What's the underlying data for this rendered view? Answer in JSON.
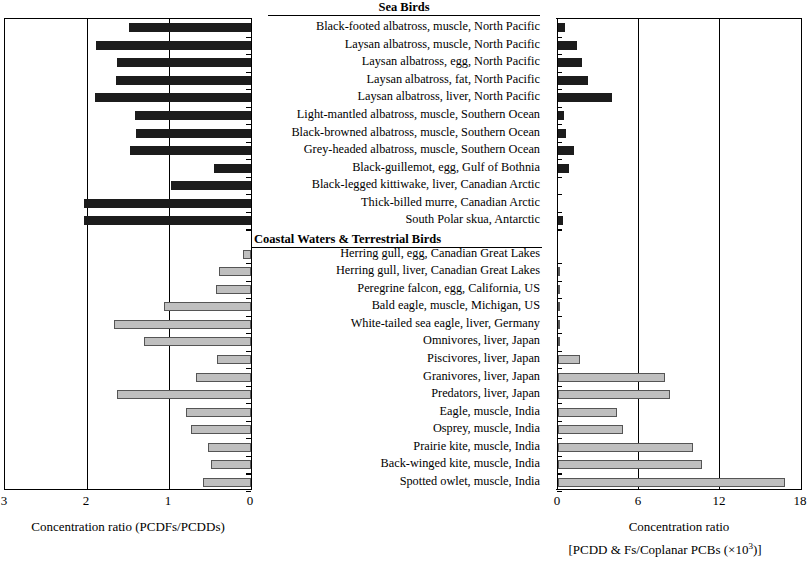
{
  "chart_data": {
    "type": "bar",
    "title": "",
    "orientation": "horizontal",
    "layout": "back-to-back paired horizontal bars with shared centered category labels",
    "groups": [
      {
        "name": "Sea Birds",
        "start_index": 0,
        "count": 12,
        "bar_color": "#1c1c1c"
      },
      {
        "name": "Coastal Waters & Terrestrial Birds",
        "start_index": 12,
        "count": 14,
        "bar_color": "#bfbfbf"
      }
    ],
    "categories": [
      "Black-footed albatross, muscle, North Pacific",
      "Laysan albatross, muscle, North Pacific",
      "Laysan albatross, egg, North Pacific",
      "Laysan albatross, fat, North Pacific",
      "Laysan albatross, liver, North Pacific",
      "Light-mantled albatross, muscle, Southern Ocean",
      "Black-browned albatross, muscle, Southern Ocean",
      "Grey-headed albatross, muscle, Southern Ocean",
      "Black-guillemot, egg, Gulf of Bothnia",
      "Black-legged kittiwake, liver, Canadian Arctic",
      "Thick-billed murre, Canadian Arctic",
      "South Polar skua, Antarctic",
      "Herring gull, egg, Canadian Great Lakes",
      "Herring gull, liver, Canadian Great Lakes",
      "Peregrine falcon, egg, California, US",
      "Bald eagle, muscle, Michigan, US",
      "White-tailed sea eagle, liver, Germany",
      "Omnivores, liver, Japan",
      "Piscivores, liver, Japan",
      "Granivores, liver, Japan",
      "Predators, liver, Japan",
      "Eagle, muscle, India",
      "Osprey, muscle, India",
      "Prairie kite, muscle, India",
      "Back-winged kite, muscle, India",
      "Spotted owlet, muscle, India"
    ],
    "series": [
      {
        "name": "Concentration ratio (PCDFs/PCDDs)",
        "panel": "left",
        "direction": "right-to-left",
        "axis_label": "Concentration ratio (PCDFs/PCDDs)",
        "ticks": [
          3,
          2,
          1,
          0
        ],
        "axis_min": 0,
        "axis_max": 3,
        "values": [
          1.49,
          1.89,
          1.63,
          1.65,
          1.9,
          1.42,
          1.4,
          1.47,
          0.45,
          0.98,
          2.04,
          2.04,
          0.1,
          0.39,
          0.43,
          1.06,
          1.67,
          1.3,
          0.41,
          0.67,
          1.63,
          0.79,
          0.73,
          0.53,
          0.49,
          0.59
        ]
      },
      {
        "name": "Concentration ratio [PCDD & Fs/Coplanar PCBs (x10^3)]",
        "panel": "right",
        "direction": "left-to-right",
        "axis_label_line1": "Concentration ratio",
        "axis_label_line2_prefix": "[PCDD & Fs/Coplanar PCBs (×10",
        "axis_label_line2_sup": "3",
        "axis_label_line2_suffix": ")]",
        "ticks": [
          0,
          6,
          12,
          18
        ],
        "axis_min": 0,
        "axis_max": 18,
        "values": [
          0.5,
          1.4,
          1.8,
          2.2,
          4.0,
          0.45,
          0.6,
          1.2,
          0.85,
          0.0,
          0.0,
          0.4,
          0.0,
          0.1,
          0.12,
          0.15,
          0.1,
          0.1,
          1.6,
          7.9,
          8.3,
          4.4,
          4.8,
          10.0,
          10.7,
          16.8
        ]
      }
    ],
    "grid": true,
    "legend": null,
    "colors": {
      "sea_birds_bar": "#1c1c1c",
      "coastal_terrestrial_bar": "#bfbfbf",
      "axis": "#000000",
      "background": "#ffffff"
    }
  },
  "left_axis": {
    "tick_labels": [
      "3",
      "2",
      "1",
      "0"
    ],
    "caption": "Concentration ratio (PCDFs/PCDDs)"
  },
  "right_axis": {
    "tick_labels": [
      "0",
      "6",
      "12",
      "18"
    ],
    "caption_line1": "Concentration ratio",
    "caption_line2_prefix": "[PCDD & Fs/Coplanar PCBs (×10",
    "caption_line2_sup": "3",
    "caption_line2_suffix": ")]"
  },
  "headers": {
    "sea_birds": "Sea Birds",
    "coastal": "Coastal Waters & Terrestrial Birds"
  }
}
